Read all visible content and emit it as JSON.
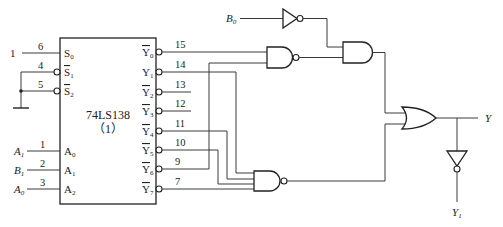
{
  "chip": {
    "part_number": "74LS138",
    "instance": "（1）",
    "inputs": [
      {
        "pin": "6",
        "label": "S",
        "sub": "0",
        "active_low": false,
        "signal": "1"
      },
      {
        "pin": "4",
        "label": "S",
        "sub": "1",
        "active_low": true,
        "signal": "GND"
      },
      {
        "pin": "5",
        "label": "S",
        "sub": "2",
        "active_low": true,
        "signal": "GND"
      },
      {
        "pin": "1",
        "label": "A",
        "sub": "0",
        "active_low": false,
        "signal_name": "A",
        "signal_sub": "1"
      },
      {
        "pin": "2",
        "label": "A",
        "sub": "1",
        "active_low": false,
        "signal_name": "B",
        "signal_sub": "1"
      },
      {
        "pin": "3",
        "label": "A",
        "sub": "2",
        "active_low": false,
        "signal_name": "A",
        "signal_sub": "0"
      }
    ],
    "outputs": [
      {
        "pin": "15",
        "label": "Y",
        "sub": "0",
        "active_low": true
      },
      {
        "pin": "14",
        "label": "Y",
        "sub": "1",
        "active_low": false
      },
      {
        "pin": "13",
        "label": "Y",
        "sub": "2",
        "active_low": true
      },
      {
        "pin": "12",
        "label": "Y",
        "sub": "3",
        "active_low": true
      },
      {
        "pin": "11",
        "label": "Y",
        "sub": "4",
        "active_low": true
      },
      {
        "pin": "10",
        "label": "Y",
        "sub": "5",
        "active_low": true
      },
      {
        "pin": "9",
        "label": "Y",
        "sub": "6",
        "active_low": true
      },
      {
        "pin": "7",
        "label": "Y",
        "sub": "7",
        "active_low": true
      }
    ]
  },
  "signals": {
    "b0": {
      "name": "B",
      "sub": "0"
    },
    "y_out": {
      "name": "Y"
    },
    "y1_out": {
      "name": "Y",
      "sub": "1"
    },
    "s0_level": "1"
  },
  "gates": [
    {
      "id": "inv-b0",
      "type": "NOT",
      "inputs": [
        "B0"
      ]
    },
    {
      "id": "nand2",
      "type": "NAND",
      "inputs": [
        "Y0'",
        "Y6'"
      ]
    },
    {
      "id": "and2",
      "type": "AND",
      "inputs": [
        "NOT B0",
        "nand2"
      ]
    },
    {
      "id": "nand4",
      "type": "NAND",
      "inputs": [
        "Y1",
        "Y4'",
        "Y5'",
        "Y7'"
      ]
    },
    {
      "id": "or2",
      "type": "OR",
      "inputs": [
        "and2",
        "nand4"
      ],
      "output": "Y"
    },
    {
      "id": "inv-y",
      "type": "NOT",
      "inputs": [
        "Y"
      ],
      "output": "Y1"
    }
  ],
  "colors": {
    "line": "#3a3a3a",
    "background": "#ffffff"
  }
}
